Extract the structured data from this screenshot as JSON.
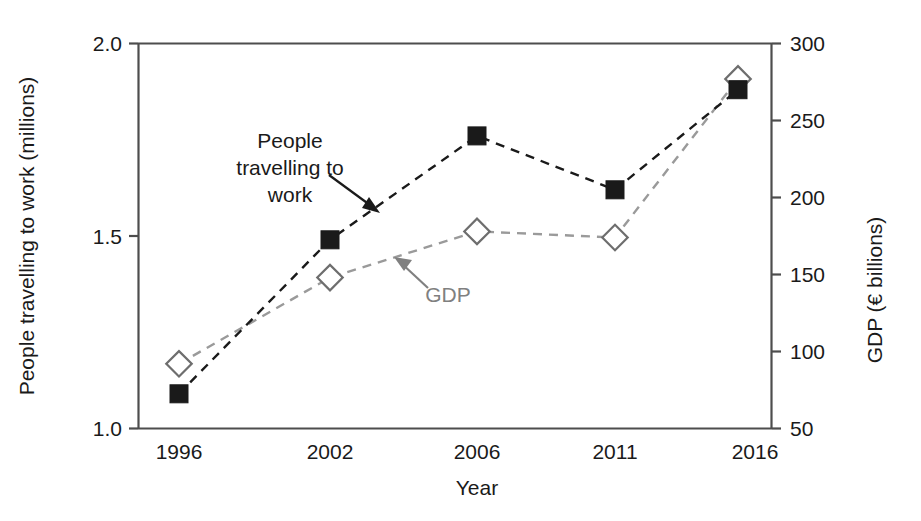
{
  "chart_data": {
    "type": "line",
    "title": "",
    "xlabel": "Year",
    "categories": [
      "1996",
      "2002",
      "2006",
      "2011",
      "2016"
    ],
    "x_tick_labels": [
      "1996",
      "2002",
      "2006",
      "2011",
      "2016"
    ],
    "grid": false,
    "legend_position": "inline-annotations",
    "left_axis": {
      "label": "People travelling to work (millions)",
      "ylim": [
        1.0,
        2.0
      ],
      "ticks": [
        1.0,
        1.5,
        2.0
      ],
      "tick_labels": [
        "1.0",
        "1.5",
        "2.0"
      ]
    },
    "right_axis": {
      "label": "GDP (€ billions)",
      "ylim": [
        50,
        300
      ],
      "ticks": [
        50,
        100,
        150,
        200,
        250,
        300
      ],
      "tick_labels": [
        "50",
        "100",
        "150",
        "200",
        "250",
        "300"
      ]
    },
    "series": [
      {
        "name": "People travelling to work",
        "axis": "left",
        "marker": "filled-square",
        "color": "#1a1a1a",
        "linestyle": "dashed",
        "values": [
          1.09,
          1.49,
          1.76,
          1.62,
          1.88
        ]
      },
      {
        "name": "GDP",
        "axis": "right",
        "marker": "open-diamond",
        "color": "#9a9a9a",
        "linestyle": "dashed",
        "values": [
          92,
          148,
          178,
          174,
          277
        ]
      }
    ],
    "annotations": [
      {
        "text_lines": [
          "People",
          "travelling to",
          "work"
        ],
        "target_series": "People travelling to work",
        "color": "#1a1a1a"
      },
      {
        "text_lines": [
          "GDP"
        ],
        "target_series": "GDP",
        "color": "#808080"
      }
    ]
  },
  "axes": {
    "left_title": "People travelling to work (millions)",
    "right_title": "GDP (€ billions)",
    "x_title": "Year",
    "left_ticks": [
      "2.0",
      "1.5",
      "1.0"
    ],
    "right_ticks": [
      "300",
      "250",
      "200",
      "150",
      "100",
      "50"
    ],
    "x_ticks": [
      "1996",
      "2002",
      "2006",
      "2011",
      "2016"
    ]
  },
  "annotations": {
    "people_line1": "People",
    "people_line2": "travelling to",
    "people_line3": "work",
    "gdp": "GDP"
  }
}
